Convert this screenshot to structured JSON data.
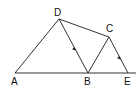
{
  "diagram": {
    "type": "geometry",
    "points": {
      "A": {
        "label": "A",
        "x": 15,
        "y": 73
      },
      "B": {
        "label": "B",
        "x": 88,
        "y": 73
      },
      "C": {
        "label": "C",
        "x": 109,
        "y": 37
      },
      "D": {
        "label": "D",
        "x": 59,
        "y": 19
      },
      "E": {
        "label": "E",
        "x": 128,
        "y": 73
      }
    },
    "segments": [
      "AE",
      "AD",
      "DB",
      "DC",
      "BC",
      "CE"
    ],
    "parallel_marks": [
      "DB",
      "CE"
    ],
    "line_color": "#333333"
  }
}
